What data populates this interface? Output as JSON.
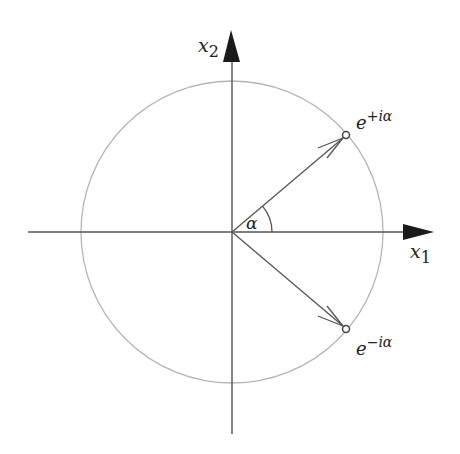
{
  "diagram": {
    "type": "unit-circle-complex-exponentials",
    "colors": {
      "axis": "#555555",
      "circle": "#b5b5b5",
      "vector": "#555555",
      "arrowhead": "#1a1a1a",
      "text": "#222222"
    },
    "axes": {
      "x_label": {
        "base": "x",
        "sub": "1"
      },
      "y_label": {
        "base": "x",
        "sub": "2"
      }
    },
    "angle_label": "α",
    "points": [
      {
        "id": "upper",
        "label_base": "e",
        "label_sup": "+iα"
      },
      {
        "id": "lower",
        "label_base": "e",
        "label_sup": "−iα"
      }
    ]
  }
}
